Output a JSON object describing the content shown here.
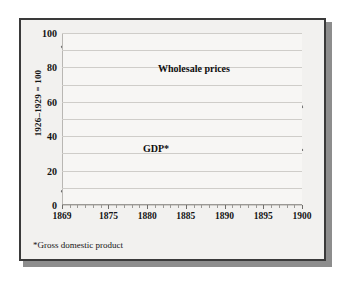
{
  "figure": {
    "ylabel": "1926–1929 = 100",
    "footnote": "*Gross domestic product"
  },
  "chart_data": {
    "type": "line",
    "title": "",
    "xlabel": "",
    "ylabel": "1926–1929 = 100",
    "xlim": [
      1869,
      1900
    ],
    "ylim": [
      0,
      100
    ],
    "grid": true,
    "gridlines_y": [
      0,
      10,
      20,
      30,
      40,
      50,
      60,
      70,
      80,
      90,
      100
    ],
    "ytick_labels": [
      0,
      20,
      40,
      60,
      80,
      100
    ],
    "xtick_labels": [
      1869,
      1875,
      1880,
      1885,
      1890,
      1895,
      1900
    ],
    "xtick_minor_step": 1,
    "legend_position": "inline-annotations",
    "line_color": "#6e6e6e",
    "series": [
      {
        "name": "Wholesale prices",
        "label_text": "Wholesale prices",
        "x": [
          1869,
          1870,
          1871,
          1872,
          1873,
          1874,
          1875,
          1876,
          1877,
          1878,
          1879,
          1880,
          1881,
          1882,
          1883,
          1884,
          1885,
          1886,
          1887,
          1888,
          1889,
          1890,
          1891,
          1892,
          1893,
          1894,
          1895,
          1896,
          1897,
          1898,
          1899,
          1900
        ],
        "values": [
          92,
          87,
          84,
          86,
          85,
          79,
          72,
          64,
          59,
          62,
          65,
          64,
          61,
          58,
          55,
          55,
          54,
          53,
          54,
          53,
          50,
          47,
          47,
          47,
          46,
          49,
          52,
          56,
          57,
          53,
          65,
          57
        ]
      },
      {
        "name": "GDP*",
        "label_text": "GDP*",
        "x": [
          1869,
          1870,
          1871,
          1872,
          1873,
          1874,
          1875,
          1876,
          1877,
          1878,
          1879,
          1880,
          1881,
          1882,
          1883,
          1884,
          1885,
          1886,
          1887,
          1888,
          1889,
          1890,
          1891,
          1892,
          1893,
          1894,
          1895,
          1896,
          1897,
          1898,
          1899,
          1900
        ],
        "values": [
          8,
          8.6,
          9.1,
          9.6,
          10.1,
          10.3,
          10.5,
          10.6,
          11.1,
          11.8,
          12.8,
          13.8,
          14.7,
          15.6,
          16.4,
          17.3,
          18.2,
          19.2,
          20.2,
          21.1,
          22.0,
          22.9,
          23.8,
          24.8,
          25.5,
          26.2,
          27.0,
          27.8,
          28.6,
          29.6,
          30.7,
          32.0
        ]
      }
    ]
  }
}
